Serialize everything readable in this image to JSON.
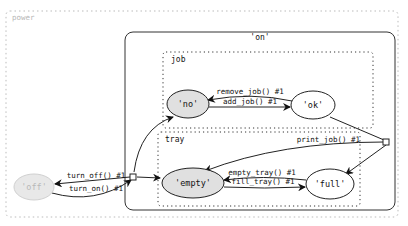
{
  "diagram": {
    "type": "state-machine",
    "regions": {
      "power": {
        "label": "power"
      },
      "on": {
        "label": "'on'"
      },
      "job": {
        "label": "job"
      },
      "tray": {
        "label": "tray"
      }
    },
    "states": {
      "off": {
        "label": "'off'",
        "inactive": true
      },
      "no": {
        "label": "'no'",
        "initial": true
      },
      "ok": {
        "label": "'ok'"
      },
      "empty": {
        "label": "'empty'",
        "initial": true
      },
      "full": {
        "label": "'full'"
      }
    },
    "transitions": {
      "turn_off": {
        "label": "turn_off() #1",
        "from": "on",
        "to": "off"
      },
      "turn_on": {
        "label": "turn_on() #1",
        "from": "off",
        "to": "on"
      },
      "remove_job": {
        "label": "remove_job() #1",
        "from": "ok",
        "to": "no"
      },
      "add_job": {
        "label": "add_job() #1",
        "from": "no",
        "to": "ok"
      },
      "print_job": {
        "label": "print_job() #1",
        "from": "ok+full",
        "to": "no+empty"
      },
      "empty_tray": {
        "label": "empty_tray() #1",
        "from": "full",
        "to": "empty"
      },
      "fill_tray": {
        "label": "fill_tray() #1",
        "from": "empty",
        "to": "full"
      }
    },
    "colors": {
      "initial_fill": "#e0e0e0",
      "inactive_fill": "#e8e8e8",
      "inactive_text": "#b8b8b8",
      "line": "#222222",
      "dotted": "#555555"
    }
  }
}
